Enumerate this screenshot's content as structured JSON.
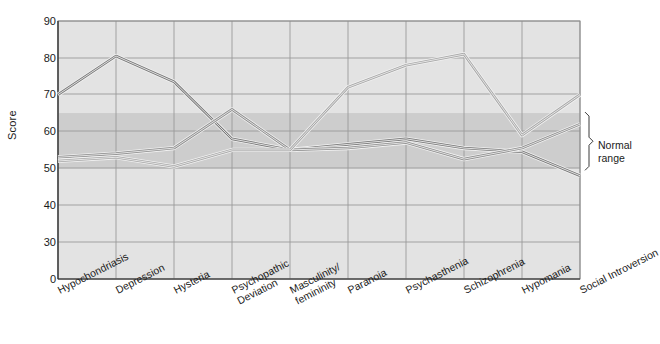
{
  "chart_data": {
    "type": "line",
    "title": "",
    "xlabel": "",
    "ylabel": "Score",
    "ylim": [
      0,
      90
    ],
    "yticks": [
      0,
      30,
      40,
      50,
      60,
      70,
      80,
      90
    ],
    "grid": true,
    "axis_break": true,
    "legend_position": "none",
    "categories": [
      "Hypochondriasis",
      "Depression",
      "Hysteria",
      "Psychopathic\nDeviation",
      "Masculinity/\nfemininity",
      "Paranoia",
      "Psychasthenia",
      "Schizophrenia",
      "Hypomania",
      "Social Introversion"
    ],
    "series": [
      {
        "name": "profile-dark",
        "color": "#7a7a7a",
        "values": [
          70,
          80.5,
          73.5,
          58,
          55,
          56.5,
          58,
          55.5,
          54.5,
          48
        ]
      },
      {
        "name": "profile-medium",
        "color": "#8f8f8f",
        "values": [
          53,
          54,
          55.5,
          66,
          55,
          55.5,
          57,
          52.5,
          55.5,
          62
        ]
      },
      {
        "name": "profile-light",
        "color": "#a8a8a8",
        "values": [
          52,
          53,
          50.5,
          55,
          55,
          72,
          78,
          81,
          59,
          70
        ]
      }
    ],
    "normal_range": {
      "label": "Normal\nrange",
      "low": 50,
      "high": 65,
      "band_color": "#cdcdcd"
    },
    "plot_bg": "#e3e3e3",
    "grid_color": "#9a9a9a"
  }
}
